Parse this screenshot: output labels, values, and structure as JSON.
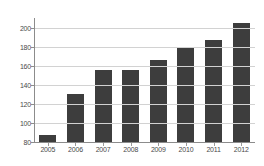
{
  "chart_data": {
    "type": "bar",
    "title": "",
    "subtitle": "",
    "xlabel": "",
    "ylabel": "",
    "categories": [
      "2005",
      "2006",
      "2007",
      "2008",
      "2009",
      "2010",
      "2011",
      "2012"
    ],
    "values": [
      87,
      131,
      156,
      156,
      167,
      180,
      188,
      206
    ],
    "ylim": [
      80,
      211
    ],
    "yticks": [
      80,
      100,
      120,
      140,
      160,
      180,
      200
    ],
    "ytick_labels": [
      "80",
      "100",
      "120",
      "140",
      "160",
      "180",
      "200"
    ],
    "grid": true,
    "grid_axis": "y",
    "legend": false,
    "legend_position": "none",
    "annotations": [],
    "series": [
      {
        "name": "",
        "values": [
          87,
          131,
          156,
          156,
          167,
          180,
          188,
          206
        ]
      }
    ],
    "colors": {
      "bar": "#3d3d3d",
      "grid": "#d2d2d2",
      "axis": "#8c8c8c",
      "tick_label": "#4a4a4a",
      "background": "#ffffff"
    }
  }
}
